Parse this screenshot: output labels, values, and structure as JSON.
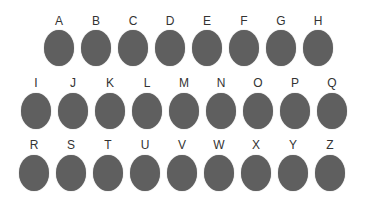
{
  "style": {
    "dot_color": "#5f5f5f",
    "label_color": "#333333",
    "background": "#ffffff"
  },
  "rows": [
    {
      "top": 14,
      "label_offset": 0,
      "dot_offset": 16,
      "start_x": 44,
      "pitch": 37,
      "letters": [
        "A",
        "B",
        "C",
        "D",
        "E",
        "F",
        "G",
        "H"
      ]
    },
    {
      "top": 76,
      "label_offset": 0,
      "dot_offset": 17,
      "start_x": 21,
      "pitch": 37,
      "letters": [
        "I",
        "J",
        "K",
        "L",
        "M",
        "N",
        "O",
        "P",
        "Q"
      ]
    },
    {
      "top": 138,
      "label_offset": 0,
      "dot_offset": 17,
      "start_x": 19,
      "pitch": 37,
      "letters": [
        "R",
        "S",
        "T",
        "U",
        "V",
        "W",
        "X",
        "Y",
        "Z"
      ]
    }
  ]
}
